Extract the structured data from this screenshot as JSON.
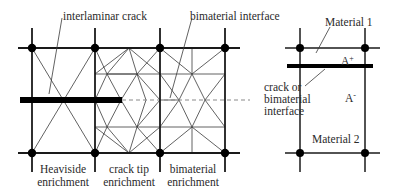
{
  "diagram": {
    "colors": {
      "line": "#1a1a1a",
      "thin_line": "#3a3a3a",
      "dash": "#8a8a8a",
      "node": "#000000",
      "crack": "#000000",
      "text": "#2a2a2a"
    },
    "left_mesh": {
      "vertical_lines_x": [
        32,
        95,
        160,
        225
      ],
      "horizontal_lines_y": [
        48,
        153
      ],
      "extent": {
        "x0": 18,
        "x1": 240,
        "y0": 28,
        "y1": 172
      },
      "nodes": [
        [
          32,
          48
        ],
        [
          95,
          48
        ],
        [
          160,
          48
        ],
        [
          225,
          48
        ],
        [
          32,
          153
        ],
        [
          95,
          153
        ],
        [
          160,
          153
        ],
        [
          225,
          153
        ]
      ],
      "crack": {
        "x0": 20,
        "x1": 122,
        "y": 100,
        "thickness": 6
      },
      "crack_extension": {
        "x0": 122,
        "x1": 250,
        "y": 100
      },
      "sub_horizontal_y": [
        74,
        127
      ],
      "triangulation_lines": [
        [
          32,
          48,
          95,
          153
        ],
        [
          95,
          48,
          32,
          153
        ],
        [
          95,
          74,
          160,
          74
        ],
        [
          95,
          127,
          160,
          127
        ],
        [
          95,
          48,
          107,
          74
        ],
        [
          129,
          48,
          107,
          74
        ],
        [
          129,
          48,
          95,
          74
        ],
        [
          129,
          48,
          137,
          74
        ],
        [
          129,
          48,
          160,
          74
        ],
        [
          160,
          48,
          137,
          74
        ],
        [
          107,
          74,
          137,
          74
        ],
        [
          107,
          74,
          95,
          100
        ],
        [
          107,
          74,
          121,
          100
        ],
        [
          137,
          74,
          121,
          100
        ],
        [
          137,
          74,
          146,
          100
        ],
        [
          137,
          74,
          160,
          100
        ],
        [
          107,
          127,
          95,
          100
        ],
        [
          107,
          127,
          121,
          100
        ],
        [
          137,
          127,
          121,
          100
        ],
        [
          137,
          127,
          146,
          100
        ],
        [
          137,
          127,
          160,
          100
        ],
        [
          95,
          153,
          107,
          127
        ],
        [
          129,
          153,
          107,
          127
        ],
        [
          129,
          153,
          95,
          127
        ],
        [
          129,
          153,
          137,
          127
        ],
        [
          129,
          153,
          160,
          127
        ],
        [
          160,
          153,
          137,
          127
        ],
        [
          160,
          74,
          225,
          74
        ],
        [
          160,
          127,
          225,
          127
        ],
        [
          192,
          48,
          192,
          74
        ],
        [
          192,
          127,
          192,
          153
        ],
        [
          160,
          48,
          192,
          74
        ],
        [
          225,
          48,
          192,
          74
        ],
        [
          160,
          74,
          179,
          100
        ],
        [
          192,
          74,
          179,
          100
        ],
        [
          192,
          74,
          205,
          100
        ],
        [
          225,
          74,
          205,
          100
        ],
        [
          160,
          127,
          179,
          100
        ],
        [
          192,
          127,
          179,
          100
        ],
        [
          192,
          127,
          205,
          100
        ],
        [
          225,
          127,
          205,
          100
        ],
        [
          160,
          153,
          192,
          127
        ],
        [
          225,
          153,
          192,
          127
        ],
        [
          160,
          100,
          179,
          100
        ]
      ],
      "labels": {
        "interlaminar_crack": "interlaminar crack",
        "bimaterial_interface": "bimaterial interface",
        "heaviside_line1": "Heaviside",
        "heaviside_line2": "enrichment",
        "cracktip_line1": "crack tip",
        "cracktip_line2": "enrichment",
        "bimaterial_line1": "bimaterial",
        "bimaterial_line2": "enrichment"
      },
      "leaders": [
        {
          "name": "interlaminar-crack-leader",
          "x1": 62,
          "y1": 18,
          "x2": 49,
          "y2": 94
        },
        {
          "name": "bimaterial-interface-leader",
          "x1": 192,
          "y1": 18,
          "x2": 170,
          "y2": 98
        }
      ]
    },
    "right_element": {
      "vertical_lines_x": [
        300,
        365
      ],
      "horizontal_lines_y": [
        48,
        153
      ],
      "extent": {
        "x0": 285,
        "x1": 380,
        "y0": 28,
        "y1": 172
      },
      "nodes": [
        [
          300,
          48
        ],
        [
          365,
          48
        ],
        [
          300,
          153
        ],
        [
          365,
          153
        ]
      ],
      "interface_bar": {
        "x0": 287,
        "x1": 373,
        "y": 66,
        "thickness": 4
      },
      "labels": {
        "material_1": "Material 1",
        "material_2": "Material 2",
        "a_plus_base": "A",
        "a_plus_sup": "+",
        "a_minus_base": "A",
        "a_minus_sup": "-",
        "crack_line1": "crack or",
        "crack_line2": "bimaterial",
        "crack_line3": "interface"
      },
      "leaders": [
        {
          "name": "material-1-leader",
          "x1": 330,
          "y1": 27,
          "x2": 316,
          "y2": 53
        },
        {
          "name": "crack-or-interface-leader",
          "x1": 305,
          "y1": 86,
          "x2": 325,
          "y2": 69
        }
      ]
    }
  }
}
